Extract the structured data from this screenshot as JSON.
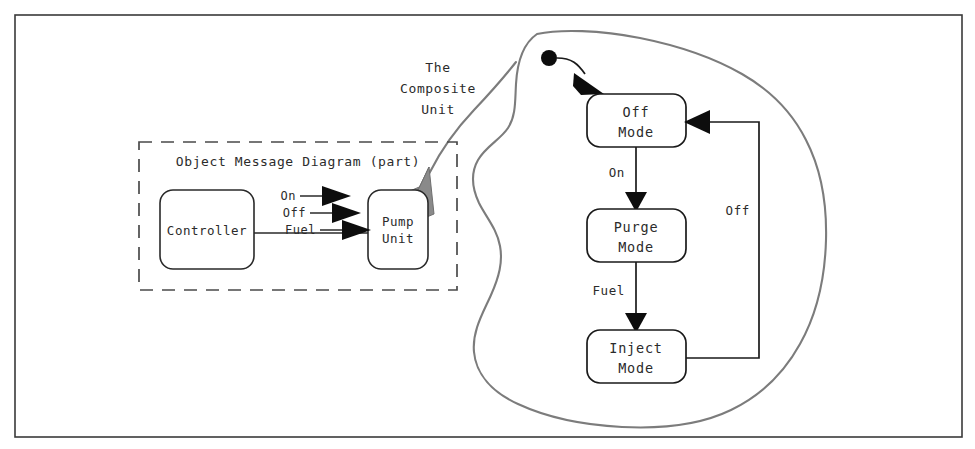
{
  "figure": {
    "outer_frame": true,
    "callout_label": [
      "The",
      "Composite",
      "Unit"
    ],
    "callout_label_text": "The Composite Unit"
  },
  "object_message_diagram": {
    "title": "Object Message Diagram (part)",
    "boxes": [
      {
        "id": "controller",
        "label_lines": [
          "Controller"
        ],
        "label": "Controller"
      },
      {
        "id": "pump-unit",
        "label_lines": [
          "Pump",
          "Unit"
        ],
        "label": "Pump Unit"
      }
    ],
    "messages": [
      {
        "name": "On",
        "from": "Controller",
        "to": "Pump Unit"
      },
      {
        "name": "Off",
        "from": "Controller",
        "to": "Pump Unit"
      },
      {
        "name": "Fuel",
        "from": "Controller",
        "to": "Pump Unit"
      }
    ]
  },
  "state_diagram": {
    "initial_state_marker": "filled-circle",
    "states": [
      {
        "id": "off-mode",
        "line1": "Off",
        "line2": "Mode",
        "label": "Off Mode"
      },
      {
        "id": "purge-mode",
        "line1": "Purge",
        "line2": "Mode",
        "label": "Purge Mode"
      },
      {
        "id": "inject-mode",
        "line1": "Inject",
        "line2": "Mode",
        "label": "Inject Mode"
      }
    ],
    "transitions": [
      {
        "id": "t-init",
        "label": "",
        "from": "initial",
        "to": "Off Mode"
      },
      {
        "id": "t-on",
        "label": "On",
        "from": "Off Mode",
        "to": "Purge Mode"
      },
      {
        "id": "t-fuel",
        "label": "Fuel",
        "from": "Purge Mode",
        "to": "Inject Mode"
      },
      {
        "id": "t-off",
        "label": "Off",
        "from": "Inject Mode",
        "to": "Off Mode"
      }
    ]
  },
  "colors": {
    "ink": "#1a1a1a",
    "blob_outline": "#7c7c7c",
    "grey_arrow": "#8a8a8a",
    "frame": "#3a3a3a",
    "background": "#ffffff"
  }
}
